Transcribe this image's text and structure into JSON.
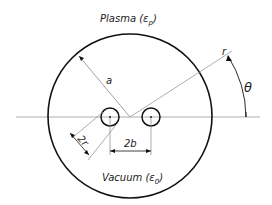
{
  "diagram": {
    "title_top": "Plasma (ε",
    "labels": {
      "plasma": "Plasma (",
      "plasma_eps": "ε",
      "plasma_sub": "p",
      "plasma_close": ")",
      "vacuum": "Vacuum (",
      "vacuum_eps": "ε",
      "vacuum_sub": "0",
      "vacuum_close": ")",
      "radius_a": "a",
      "radius_r": "r",
      "angle": "θ",
      "wire_diameter": "2r",
      "wire_spacing": "2b"
    },
    "colors": {
      "stroke": "#111111",
      "thin_line": "#888888",
      "background": "#ffffff"
    },
    "geometry": {
      "outer_circle": {
        "cx": 130,
        "cy": 116,
        "r": 82
      },
      "wires": [
        {
          "cx": 110,
          "cy": 117,
          "r": 9
        },
        {
          "cx": 151,
          "cy": 117,
          "r": 9
        }
      ]
    }
  }
}
